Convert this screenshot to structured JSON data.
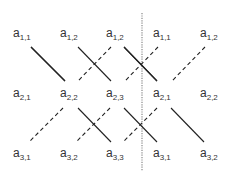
{
  "diagram": {
    "rows": [
      [
        "a",
        "a",
        "a",
        "a",
        "a"
      ],
      [
        "a",
        "a",
        "a",
        "a",
        "a"
      ],
      [
        "a",
        "a",
        "a",
        "a",
        "a"
      ]
    ],
    "subscripts": [
      [
        "1,1",
        "1,2",
        "1,2",
        "1,1",
        "1,2"
      ],
      [
        "2,1",
        "2,2",
        "2,3",
        "2,1",
        "2,2"
      ],
      [
        "3,1",
        "3,2",
        "3,3",
        "3,1",
        "3,2"
      ]
    ],
    "separator": {
      "style": "dotted",
      "after_column": 3
    },
    "solid_diagonals": [
      {
        "from": "a1,1",
        "to": "a2,2"
      },
      {
        "from": "a1,2",
        "to": "a2,3"
      },
      {
        "from": "a1,2",
        "to": "a2,1"
      },
      {
        "from": "a2,2",
        "to": "a3,3"
      },
      {
        "from": "a2,3",
        "to": "a3,1"
      },
      {
        "from": "a2,1",
        "to": "a3,2"
      }
    ],
    "dashed_diagonals": [
      {
        "from": "a1,2",
        "to": "a2,2"
      },
      {
        "from": "a1,1",
        "to": "a2,3"
      },
      {
        "from": "a1,2",
        "to": "a2,1"
      },
      {
        "from": "a2,2",
        "to": "a3,1"
      },
      {
        "from": "a2,3",
        "to": "a3,2"
      },
      {
        "from": "a2,1",
        "to": "a3,3"
      }
    ],
    "colors": {
      "text": "#333333",
      "lines": "#222222",
      "separator": "#888888"
    }
  }
}
